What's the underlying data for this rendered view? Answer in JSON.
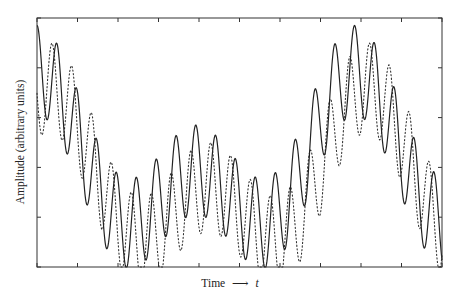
{
  "chart_data": {
    "type": "line",
    "title": "",
    "xlabel": "Time",
    "xlabel_arrow": "⟶",
    "xlabel_var": "t",
    "ylabel": "Amplitude (arbitrary units)",
    "xlim": [
      0,
      10
    ],
    "ylim": [
      0,
      5
    ],
    "x_ticks": [
      0,
      1,
      2,
      3,
      4,
      5,
      6,
      7,
      8,
      9,
      10
    ],
    "y_ticks": [
      0,
      1,
      2,
      3,
      4,
      5
    ],
    "tick_labels_shown": false,
    "grid": false,
    "legend": null,
    "model": {
      "description": "y = a + b*cos(w*x) + d*cos(2*w*x) + A*cos(2*pi*(x - phase)/P)",
      "envelope_period": 7.85,
      "a": 1.975,
      "b": 1.0,
      "d": 0.975,
      "carrier_period": 0.49,
      "amplitude": 0.9
    },
    "series": [
      {
        "name": "solid",
        "style": "solid",
        "color": "#222222",
        "carrier_phase": 0.0,
        "envelope_shift": 0.0,
        "offset": 0.0,
        "peaks": [
          [
            0,
            4.86
          ],
          [
            0.47,
            4.5
          ],
          [
            0.96,
            3.6
          ],
          [
            1.46,
            2.55
          ],
          [
            1.95,
            1.85
          ],
          [
            2.44,
            1.75
          ],
          [
            2.94,
            2.15
          ],
          [
            3.43,
            2.63
          ],
          [
            3.93,
            2.85
          ],
          [
            4.42,
            2.63
          ],
          [
            4.91,
            2.15
          ],
          [
            5.41,
            1.75
          ],
          [
            5.9,
            1.85
          ],
          [
            6.4,
            2.55
          ],
          [
            6.89,
            3.6
          ],
          [
            7.38,
            4.5
          ],
          [
            7.85,
            4.86
          ],
          [
            8.35,
            4.5
          ],
          [
            8.81,
            3.6
          ],
          [
            9.31,
            2.55
          ],
          [
            9.8,
            1.85
          ]
        ],
        "troughs": [
          [
            0.25,
            3.05
          ],
          [
            0.74,
            2.4
          ],
          [
            1.21,
            1.35
          ],
          [
            1.7,
            0.4
          ],
          [
            2.2,
            0.02
          ],
          [
            2.69,
            0.44
          ],
          [
            3.19,
            0.68
          ],
          [
            3.68,
            1.08
          ],
          [
            4.17,
            1.14
          ],
          [
            4.67,
            0.7
          ],
          [
            5.16,
            0.2
          ],
          [
            5.65,
            0.02
          ],
          [
            6.15,
            0.42
          ],
          [
            6.64,
            1.35
          ],
          [
            7.14,
            2.4
          ],
          [
            7.63,
            3.05
          ],
          [
            8.1,
            3.09
          ],
          [
            8.59,
            2.4
          ],
          [
            9.09,
            1.35
          ],
          [
            9.58,
            0.4
          ]
        ]
      },
      {
        "name": "dotted",
        "style": "dotted",
        "color": "#333333",
        "carrier_phase": -0.12,
        "envelope_shift": 0.3,
        "offset": -0.35,
        "peaks": [
          [
            1.6,
            1.9
          ],
          [
            2.1,
            1.75
          ],
          [
            2.6,
            2.2
          ],
          [
            3.1,
            2.75
          ],
          [
            3.6,
            3.2
          ],
          [
            4.1,
            3.1
          ],
          [
            4.6,
            2.7
          ],
          [
            5.1,
            2.2
          ],
          [
            5.6,
            1.75
          ],
          [
            6.1,
            2.0
          ],
          [
            6.6,
            2.8
          ],
          [
            7.1,
            3.7
          ],
          [
            7.6,
            4.3
          ]
        ],
        "troughs": [
          [
            0.12,
            2.7
          ],
          [
            0.62,
            1.6
          ],
          [
            1.1,
            0.7
          ],
          [
            1.6,
            0.2
          ],
          [
            2.1,
            0.4
          ],
          [
            4.9,
            0.2
          ],
          [
            5.4,
            0.1
          ],
          [
            9.4,
            0.3
          ],
          [
            9.9,
            0.1
          ]
        ]
      }
    ]
  },
  "layout": {
    "plot_left": 37,
    "plot_top": 18,
    "plot_right": 442,
    "plot_bottom": 267
  }
}
